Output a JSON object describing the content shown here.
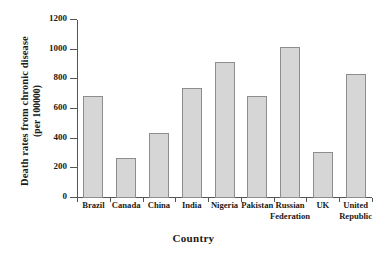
{
  "chart_data": {
    "type": "bar",
    "title": "",
    "xlabel": "Country",
    "ylabel_line1": "Death rates from chronic disease",
    "ylabel_line2": "(per 100000)",
    "categories": [
      "Brazil",
      "Canada",
      "China",
      "India",
      "Nigeria",
      "Pakistan",
      "Russian Federation",
      "UK",
      "United Republic"
    ],
    "category_lines": [
      [
        "Brazil"
      ],
      [
        "Canada"
      ],
      [
        "China"
      ],
      [
        "India"
      ],
      [
        "Nigeria"
      ],
      [
        "Pakistan"
      ],
      [
        "Russian",
        "Federation"
      ],
      [
        "UK"
      ],
      [
        "United",
        "Republic"
      ]
    ],
    "values": [
      685,
      270,
      440,
      740,
      915,
      685,
      1020,
      310,
      835
    ],
    "ylim": [
      0,
      1200
    ],
    "yticks": [
      0,
      200,
      400,
      600,
      800,
      1000,
      1200
    ],
    "ytick_labels": [
      "0",
      "200",
      "400",
      "600",
      "800",
      "1000",
      "1200"
    ],
    "grid": false,
    "legend": "none",
    "bar_fill_color": "#d6d6d6",
    "bar_edge_color": "#8d8d8d",
    "axis_color": "#555555",
    "text_color": "#1a1a1a"
  }
}
